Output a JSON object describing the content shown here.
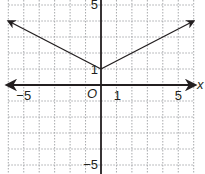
{
  "chart_data": {
    "type": "line",
    "title": "",
    "function": "y = 0.5|x| + 1",
    "xlabel": "x",
    "ylabel": "",
    "xlim": [
      -6,
      6
    ],
    "ylim": [
      -5.3,
      5.3
    ],
    "grid": true,
    "grid_style": "dotted",
    "origin_label": "O",
    "x_tick_labels": [
      {
        "value": -5,
        "label": "−5"
      },
      {
        "value": 1,
        "label": "1"
      },
      {
        "value": 5,
        "label": "5"
      }
    ],
    "y_tick_labels": [
      {
        "value": 5,
        "label": "5"
      },
      {
        "value": 1,
        "label": "1"
      },
      {
        "value": -5,
        "label": "−5"
      }
    ],
    "series": [
      {
        "name": "absolute value graph",
        "x": [
          -6,
          0,
          6
        ],
        "y": [
          4,
          1,
          4
        ],
        "arrows_at_ends": true
      }
    ],
    "colors": {
      "axis": "#231f20",
      "curve": "#231f20",
      "grid": "#a7a9ac"
    }
  }
}
